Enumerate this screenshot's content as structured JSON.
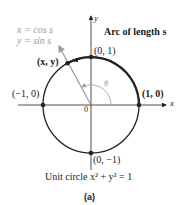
{
  "diagram": {
    "param_x": "x = cos s",
    "param_y": "y = sin s",
    "arc_label": "Arc of length s",
    "point_xy": "(x, y)",
    "point_top": "(0, 1)",
    "point_left": "(−1, 0)",
    "point_right": "(1, 0)",
    "point_bottom": "(0, −1)",
    "origin": "0",
    "theta": "θ",
    "axis_x": "x",
    "axis_y": "y",
    "caption": "Unit circle x² + y² = 1",
    "subcaption": "(a)"
  },
  "colors": {
    "line": "#222222",
    "gray": "#9a9a9a"
  }
}
